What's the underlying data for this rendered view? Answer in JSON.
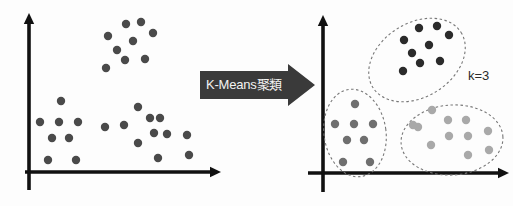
{
  "figure": {
    "width": 513,
    "height": 206,
    "background_color": "#fdfdfd"
  },
  "transform_arrow": {
    "label": "K-Means聚類",
    "icon": "right-arrow-icon",
    "fill_color": "#3a3a3a",
    "text_color": "#f2f2f2"
  },
  "annotations": {
    "k_label": "k=3"
  },
  "axes": {
    "color": "#111111",
    "left": {
      "x_axis_y": 172,
      "y_axis_x": 29,
      "x_start": 25,
      "x_end": 212,
      "y_top": 22,
      "y_bottom": 190
    },
    "right": {
      "x_axis_y": 173,
      "y_axis_x": 323,
      "x_start": 308,
      "x_end": 500,
      "y_top": 24,
      "y_bottom": 192
    }
  },
  "chart_data": {
    "type": "scatter",
    "xlabel": "",
    "ylabel": "",
    "grid": false,
    "legend": false,
    "panels": [
      {
        "name": "before-clustering",
        "caption": "unlabeled points",
        "point_color": "#4a4a4a",
        "point_radius": 4.2,
        "ellipses": [],
        "series": [
          {
            "name": "all-points",
            "color": "#4a4a4a",
            "points": [
              [
                126,
                24
              ],
              [
                141,
                22
              ],
              [
                108,
                36
              ],
              [
                133,
                41
              ],
              [
                153,
                33
              ],
              [
                117,
                50
              ],
              [
                125,
                60
              ],
              [
                106,
                68
              ],
              [
                145,
                59
              ],
              [
                61,
                101
              ],
              [
                40,
                122
              ],
              [
                59,
                122
              ],
              [
                78,
                122
              ],
              [
                52,
                138
              ],
              [
                69,
                138
              ],
              [
                48,
                160
              ],
              [
                76,
                160
              ],
              [
                138,
                107
              ],
              [
                124,
                125
              ],
              [
                150,
                118
              ],
              [
                160,
                118
              ],
              [
                154,
                133
              ],
              [
                167,
                134
              ],
              [
                105,
                127
              ],
              [
                138,
                143
              ],
              [
                187,
                135
              ],
              [
                158,
                158
              ],
              [
                189,
                155
              ]
            ]
          }
        ]
      },
      {
        "name": "after-clustering",
        "caption": "three discovered clusters",
        "clusters": [
          {
            "name": "cluster-1-top",
            "color": "#2b2b2b",
            "point_radius": 4.2,
            "ellipse": {
              "cx": 417,
              "cy": 60,
              "rx": 52,
              "ry": 37,
              "rotation": -32
            },
            "points": [
              [
                419,
                28
              ],
              [
                437,
                26
              ],
              [
                404,
                40
              ],
              [
                429,
                45
              ],
              [
                449,
                35
              ],
              [
                412,
                53
              ],
              [
                420,
                63
              ],
              [
                403,
                71
              ],
              [
                440,
                61
              ]
            ]
          },
          {
            "name": "cluster-2-left",
            "color": "#6f6f6f",
            "point_radius": 4.2,
            "ellipse": {
              "cx": 355,
              "cy": 133,
              "rx": 31,
              "ry": 44,
              "rotation": -8
            },
            "points": [
              [
                355,
                104
              ],
              [
                335,
                124
              ],
              [
                354,
                124
              ],
              [
                373,
                124
              ],
              [
                347,
                140
              ],
              [
                364,
                140
              ],
              [
                343,
                162
              ],
              [
                370,
                162
              ]
            ]
          },
          {
            "name": "cluster-3-right",
            "color": "#a9a9a9",
            "point_radius": 4.2,
            "ellipse": {
              "cx": 452,
              "cy": 140,
              "rx": 51,
              "ry": 35,
              "rotation": -4
            },
            "points": [
              [
                432,
                110
              ],
              [
                418,
                127
              ],
              [
                448,
                120
              ],
              [
                466,
                120
              ],
              [
                449,
                136
              ],
              [
                468,
                136
              ],
              [
                488,
                131
              ],
              [
                431,
                145
              ],
              [
                468,
                155
              ],
              [
                489,
                150
              ],
              [
                413,
                125
              ]
            ]
          }
        ],
        "ellipse_style": {
          "stroke": "#777777",
          "dash": "2.5 2.5",
          "width": 1.1
        }
      }
    ]
  }
}
